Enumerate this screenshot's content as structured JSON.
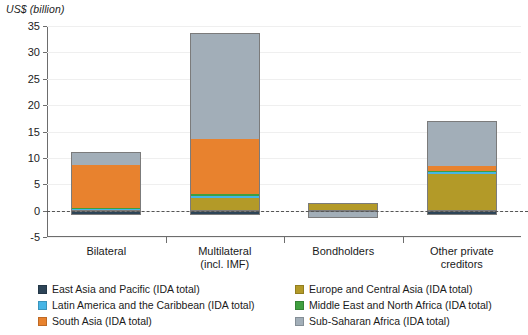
{
  "chart_data": {
    "type": "bar",
    "title": "",
    "subtitle": "",
    "xlabel": "",
    "ylabel": "US$ (billion)",
    "ylim": [
      -5,
      35
    ],
    "yticks": [
      35,
      30,
      25,
      20,
      15,
      10,
      5,
      0,
      -5
    ],
    "grid": true,
    "stacked": true,
    "legend_position": "bottom",
    "categories": [
      "Bilateral",
      "Multilateral\n(incl. IMF)",
      "Bondholders",
      "Other private\ncreditors"
    ],
    "series": [
      {
        "name": "East Asia and Pacific (IDA total)",
        "color": "#2d4457",
        "values": [
          -0.9,
          -0.9,
          -0.1,
          -0.8
        ]
      },
      {
        "name": "Europe and Central Asia (IDA total)",
        "color": "#b39a28",
        "values": [
          0.35,
          2.3,
          1.5,
          7.0
        ]
      },
      {
        "name": "Latin America and the Caribbean (IDA total)",
        "color": "#46b5e6",
        "values": [
          0.05,
          0.45,
          0.0,
          0.35
        ]
      },
      {
        "name": "Middle East and North Africa (IDA total)",
        "color": "#3f9f3f",
        "values": [
          0.05,
          0.35,
          0.0,
          0.1
        ]
      },
      {
        "name": "South Asia (IDA total)",
        "color": "#e8822e",
        "values": [
          8.2,
          10.4,
          0.0,
          1.0
        ]
      },
      {
        "name": "Sub-Saharan Africa (IDA total)",
        "color": "#a2aeb8",
        "values": [
          2.4,
          20.2,
          -1.3,
          8.5
        ]
      }
    ],
    "category_totals_positive": [
      11.05,
      33.7,
      1.5,
      16.95
    ],
    "category_totals_negative": [
      -0.9,
      -0.9,
      -1.4,
      -0.8
    ]
  },
  "axis": {
    "title": "US$ (billion)",
    "tick_labels": [
      "35",
      "30",
      "25",
      "20",
      "15",
      "10",
      "5",
      "0",
      "-5"
    ]
  },
  "categories": [
    {
      "line1": "Bilateral",
      "line2": ""
    },
    {
      "line1": "Multilateral",
      "line2": "(incl. IMF)"
    },
    {
      "line1": "Bondholders",
      "line2": ""
    },
    {
      "line1": "Other private",
      "line2": "creditors"
    }
  ],
  "legend": {
    "left": [
      {
        "label": "East Asia and Pacific (IDA total)",
        "color": "#2d4457"
      },
      {
        "label": "Latin America and the Caribbean (IDA total)",
        "color": "#46b5e6"
      },
      {
        "label": "South Asia (IDA total)",
        "color": "#e8822e"
      }
    ],
    "right": [
      {
        "label": "Europe and Central Asia (IDA total)",
        "color": "#b39a28"
      },
      {
        "label": "Middle East and North Africa (IDA total)",
        "color": "#3f9f3f"
      },
      {
        "label": "Sub-Saharan Africa (IDA total)",
        "color": "#a2aeb8"
      }
    ]
  }
}
